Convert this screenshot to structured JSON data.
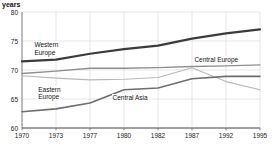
{
  "chart_data": {
    "type": "line",
    "title": "",
    "ylabel": "years",
    "xlabel": "",
    "ylim": [
      60,
      80
    ],
    "yticks": [
      60,
      65,
      70,
      75,
      80
    ],
    "x": [
      1970,
      1973,
      1977,
      1980,
      1982,
      1987,
      1992,
      1995
    ],
    "xticklabels": [
      "1970",
      "1973",
      "1977",
      "1980",
      "1982",
      "1987",
      "1992",
      "1995"
    ],
    "grid": true,
    "legend_position": "inline-annotations",
    "series": [
      {
        "name": "Western Europe",
        "color": "#3c3c3c",
        "width": 2.2,
        "values": [
          71.5,
          71.8,
          72.8,
          73.6,
          74.2,
          75.4,
          76.3,
          77.0
        ]
      },
      {
        "name": "Central Europe",
        "color": "#8f8f8f",
        "width": 1.3,
        "values": [
          69.4,
          69.8,
          70.3,
          70.3,
          70.4,
          70.6,
          70.7,
          70.9
        ]
      },
      {
        "name": "Eastern Europe",
        "color": "#b8b8b8",
        "width": 1.1,
        "values": [
          69.0,
          68.6,
          68.3,
          68.4,
          68.7,
          70.4,
          68.0,
          66.6
        ]
      },
      {
        "name": "Central Asia",
        "color": "#6e6e6e",
        "width": 1.6,
        "values": [
          62.8,
          63.3,
          64.3,
          66.6,
          66.9,
          68.5,
          68.9,
          68.9
        ]
      }
    ],
    "annotations": [
      {
        "text": "Western\nEurope",
        "x": 1971.2,
        "y": 74.3
      },
      {
        "text": "Eastern\nEurope",
        "x": 1971.6,
        "y": 66.6
      },
      {
        "text": "Central Asia",
        "x": 1979.4,
        "y": 65.2
      },
      {
        "text": "Central Europe",
        "x": 1988.0,
        "y": 71.7
      }
    ]
  },
  "axis": {
    "y_title": "years",
    "y_ticks": [
      "80",
      "75",
      "70",
      "65",
      "60"
    ],
    "x_ticks": [
      "1970",
      "1973",
      "1977",
      "1980",
      "1982",
      "1987",
      "1992",
      "1995"
    ]
  },
  "labels": {
    "western_europe": "Western\nEurope",
    "eastern_europe": "Eastern\nEurope",
    "central_asia": "Central Asia",
    "central_europe": "Central Europe"
  },
  "caption": {
    "text": ""
  }
}
